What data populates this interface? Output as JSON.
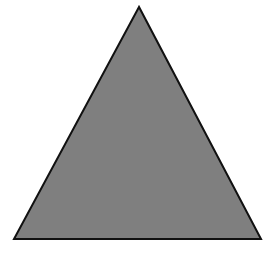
{
  "diagram": {
    "shape": "equilateral-triangle",
    "fill_color": "#7f7f7f",
    "stroke_color": "#111111",
    "background_color": "#ffffff",
    "vertices": {
      "apex": [
        139,
        7
      ],
      "bottom_left": [
        14,
        239
      ],
      "bottom_right": [
        261,
        239
      ]
    }
  }
}
